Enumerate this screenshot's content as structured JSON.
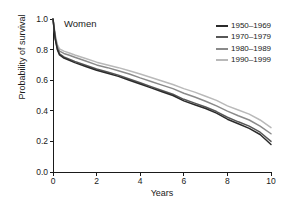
{
  "panel": {
    "label": "Women"
  },
  "axes": {
    "xlabel": "Years",
    "ylabel": "Probability of survival",
    "xticks": [
      "0",
      "2",
      "4",
      "6",
      "8",
      "10"
    ],
    "yticks": [
      "0.0",
      "0.2",
      "0.4",
      "0.6",
      "0.8",
      "1.0"
    ]
  },
  "legend": {
    "items": [
      {
        "label": "1950–1969",
        "color": "#2b2b2b"
      },
      {
        "label": "1970–1979",
        "color": "#575757"
      },
      {
        "label": "1980–1989",
        "color": "#8a8a8a"
      },
      {
        "label": "1990–1999",
        "color": "#b9b9b9"
      }
    ]
  },
  "chart_data": {
    "type": "line",
    "title": "Women",
    "xlabel": "Years",
    "ylabel": "Probability of survival",
    "xlim": [
      0,
      10
    ],
    "ylim": [
      0,
      1
    ],
    "xticks": [
      0,
      2,
      4,
      6,
      8,
      10
    ],
    "yticks": [
      0.0,
      0.2,
      0.4,
      0.6,
      0.8,
      1.0
    ],
    "grid": false,
    "legend_position": "top-right",
    "x": [
      0,
      0.1,
      0.2,
      0.3,
      0.5,
      0.75,
      1,
      1.5,
      2,
      2.5,
      3,
      3.5,
      4,
      4.5,
      5,
      5.5,
      6,
      6.5,
      7,
      7.5,
      8,
      8.5,
      9,
      9.5,
      10
    ],
    "series": [
      {
        "name": "1950–1969",
        "color": "#2b2b2b",
        "values": [
          1.0,
          0.87,
          0.8,
          0.765,
          0.745,
          0.73,
          0.715,
          0.69,
          0.665,
          0.645,
          0.625,
          0.6,
          0.575,
          0.55,
          0.525,
          0.5,
          0.465,
          0.44,
          0.415,
          0.385,
          0.345,
          0.315,
          0.285,
          0.245,
          0.18
        ]
      },
      {
        "name": "1970–1979",
        "color": "#575757",
        "values": [
          1.0,
          0.875,
          0.805,
          0.772,
          0.752,
          0.738,
          0.723,
          0.698,
          0.673,
          0.653,
          0.633,
          0.608,
          0.583,
          0.558,
          0.533,
          0.508,
          0.475,
          0.45,
          0.425,
          0.395,
          0.358,
          0.328,
          0.3,
          0.26,
          0.2
        ]
      },
      {
        "name": "1980–1989",
        "color": "#8a8a8a",
        "values": [
          1.0,
          0.885,
          0.818,
          0.79,
          0.775,
          0.763,
          0.75,
          0.725,
          0.7,
          0.682,
          0.662,
          0.64,
          0.615,
          0.592,
          0.568,
          0.545,
          0.515,
          0.49,
          0.462,
          0.432,
          0.398,
          0.368,
          0.34,
          0.3,
          0.25
        ]
      },
      {
        "name": "1990–1999",
        "color": "#b9b9b9",
        "values": [
          1.0,
          0.9,
          0.832,
          0.805,
          0.79,
          0.778,
          0.765,
          0.742,
          0.718,
          0.7,
          0.682,
          0.662,
          0.64,
          0.618,
          0.595,
          0.572,
          0.545,
          0.522,
          0.495,
          0.468,
          0.432,
          0.405,
          0.378,
          0.34,
          0.29
        ]
      }
    ]
  }
}
